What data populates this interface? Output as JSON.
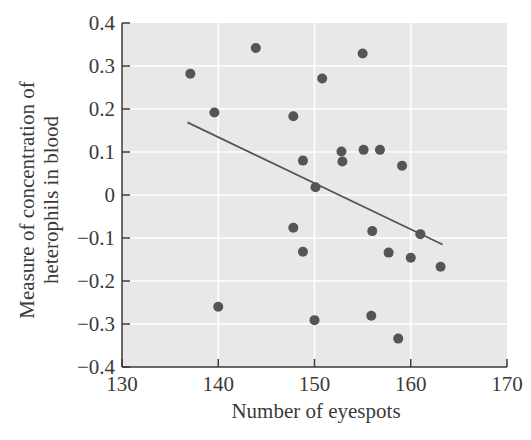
{
  "chart_data": {
    "type": "scatter",
    "title": "",
    "xlabel": "Number of eyespots",
    "ylabel_lines": [
      "Measure of concentration of",
      "heterophils in blood"
    ],
    "ylabel": "Measure of concentration of heterophils in blood",
    "xlim": [
      130,
      170
    ],
    "ylim": [
      -0.4,
      0.4
    ],
    "xticks": [
      130,
      140,
      150,
      160,
      170
    ],
    "xtick_labels": [
      "130",
      "140",
      "150",
      "160",
      "170"
    ],
    "yticks": [
      0.4,
      0.3,
      0.2,
      0.1,
      0,
      -0.1,
      -0.2,
      -0.3,
      -0.4
    ],
    "ytick_labels": [
      "0.4",
      "0.3",
      "0.2",
      "0.1",
      "0",
      "−0.1",
      "−0.2",
      "−0.3",
      "−0.4"
    ],
    "grid": true,
    "legend": null,
    "series": [
      {
        "name": "observations",
        "points": [
          {
            "x": 137.1,
            "y": 0.282
          },
          {
            "x": 139.6,
            "y": 0.192
          },
          {
            "x": 140.0,
            "y": -0.26
          },
          {
            "x": 143.9,
            "y": 0.342
          },
          {
            "x": 147.8,
            "y": 0.183
          },
          {
            "x": 147.8,
            "y": -0.076
          },
          {
            "x": 148.8,
            "y": 0.08
          },
          {
            "x": 148.8,
            "y": -0.132
          },
          {
            "x": 150.0,
            "y": -0.291
          },
          {
            "x": 150.1,
            "y": 0.018
          },
          {
            "x": 150.8,
            "y": 0.271
          },
          {
            "x": 152.8,
            "y": 0.101
          },
          {
            "x": 152.9,
            "y": 0.078
          },
          {
            "x": 155.0,
            "y": 0.329
          },
          {
            "x": 155.1,
            "y": 0.105
          },
          {
            "x": 155.9,
            "y": -0.281
          },
          {
            "x": 156.0,
            "y": -0.084
          },
          {
            "x": 156.8,
            "y": 0.105
          },
          {
            "x": 157.7,
            "y": -0.134
          },
          {
            "x": 158.7,
            "y": -0.334
          },
          {
            "x": 159.1,
            "y": 0.068
          },
          {
            "x": 160.0,
            "y": -0.146
          },
          {
            "x": 161.0,
            "y": -0.091
          },
          {
            "x": 163.1,
            "y": -0.167
          }
        ]
      }
    ],
    "trendline": {
      "x1": 136.8,
      "y1": 0.169,
      "x2": 163.3,
      "y2": -0.115
    },
    "colors": {
      "plot_background": "#e8e8e8",
      "gridline": "#ffffff",
      "point": "#555555",
      "trendline": "#555555",
      "axis": "#3a3a3a",
      "text": "#3a3a3a"
    }
  }
}
